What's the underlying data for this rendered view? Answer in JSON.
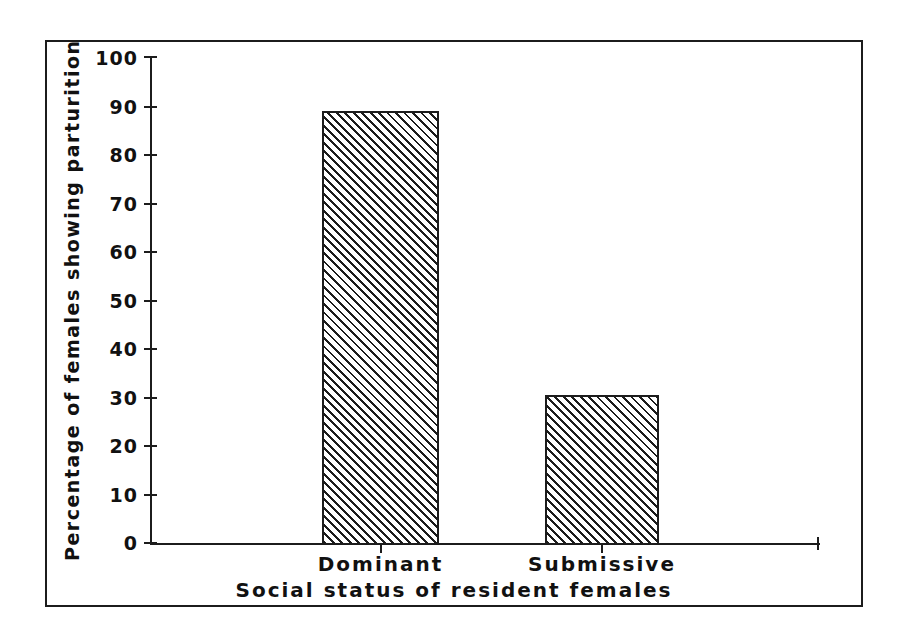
{
  "chart_data": {
    "type": "bar",
    "title": "",
    "categories": [
      "Dominant",
      "Submissive"
    ],
    "values": [
      89,
      30.5
    ],
    "series": [
      {
        "name": "Percentage of females showing parturition",
        "values": [
          89,
          30.5
        ]
      }
    ],
    "xlabel": "Social status of resident females",
    "ylabel": "Percentage of females showing parturition",
    "ylim": [
      0,
      100
    ],
    "ytick_labels": [
      "0",
      "10",
      "20",
      "30",
      "40",
      "50",
      "60",
      "70",
      "80",
      "90",
      "100"
    ],
    "ytick_values": [
      0,
      10,
      20,
      30,
      40,
      50,
      60,
      70,
      80,
      90,
      100
    ],
    "xtick_labels": [
      "Dominant",
      "Submissive"
    ],
    "grid": false,
    "legend": false,
    "legend_position": "none",
    "bar_fill": "diagonal-hatch",
    "colors": {
      "ink": "#1c1c1c",
      "background": "#ffffff",
      "hatch": "#1c1c1c"
    }
  },
  "figure": {
    "frame": "outer-border",
    "background_label": "white"
  }
}
